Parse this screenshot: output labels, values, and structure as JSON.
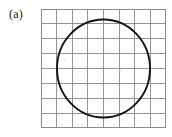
{
  "figure": {
    "panel_label": "(a)",
    "background_color": "#ffffff",
    "grid": {
      "columns": 8,
      "rows": 8,
      "line_color": "#8a8a8a",
      "left": 41,
      "top": 9,
      "width": 125,
      "height": 119,
      "cell_width": 15.625,
      "cell_height": 14.875
    },
    "shape": {
      "name": "circle",
      "stroke_color": "#141414",
      "stroke_width": 1.9,
      "center_x": 62.5,
      "center_y": 59.5,
      "radius_x": 46.5,
      "radius_y": 49.0,
      "cells_spanned_horizontally": 6,
      "cells_spanned_vertically": 6.6
    },
    "specks": [
      {
        "x": 24,
        "y": 51,
        "r": 0.7
      },
      {
        "x": 61,
        "y": 18,
        "r": 0.6
      },
      {
        "x": 99,
        "y": 45,
        "r": 0.8
      },
      {
        "x": 79,
        "y": 62,
        "r": 0.7
      },
      {
        "x": 47,
        "y": 69,
        "r": 0.6
      },
      {
        "x": 92,
        "y": 88,
        "r": 0.7
      },
      {
        "x": 37,
        "y": 96,
        "r": 0.6
      },
      {
        "x": 110,
        "y": 31,
        "r": 0.6
      }
    ]
  }
}
